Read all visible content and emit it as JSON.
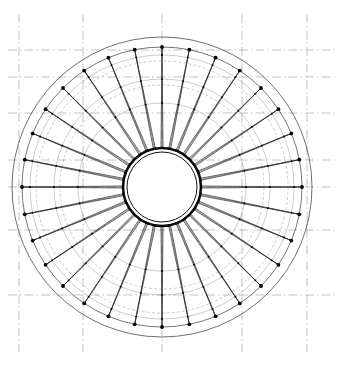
{
  "sheet": {
    "width": 342,
    "height": 366,
    "background": "#ffffff",
    "title": "",
    "caption": ""
  },
  "drawing": {
    "kind": "engineering-plan",
    "description": "Plan view of a circular spoke-wheel cable roof structure",
    "center": {
      "x": 162,
      "y": 187
    },
    "line_color": "#111111",
    "grid_color": "#9a9a9a",
    "hub_fill": "#ffffff"
  },
  "grid": {
    "style": "dash-dot",
    "color": "#9a9a9a",
    "vertical_x": [
      19,
      83,
      162,
      242,
      307
    ],
    "horizontal_y": [
      50,
      77,
      113,
      160,
      187,
      230,
      295
    ],
    "vertical_top": 14,
    "vertical_bottom": 352,
    "horizontal_left": 8,
    "horizontal_right": 336
  },
  "rings": [
    {
      "name": "outer-boundary-circle",
      "radius": 150,
      "style": "solid-thin",
      "color": "#4a4a4a"
    },
    {
      "name": "outer-node-ring",
      "radius": 140,
      "style": "solid",
      "color": "#3a3a3a"
    },
    {
      "name": "hoop-cable-ring-1",
      "radius": 132,
      "style": "solid-thin",
      "color": "#8c8c8c"
    },
    {
      "name": "hoop-cable-ring-2",
      "radius": 126,
      "style": "dashed-thin",
      "color": "#8c8c8c"
    },
    {
      "name": "hoop-cable-ring-3",
      "radius": 108,
      "style": "solid-thin",
      "color": "#8c8c8c"
    },
    {
      "name": "hoop-cable-ring-4",
      "radius": 102,
      "style": "dashed-thin",
      "color": "#8c8c8c"
    },
    {
      "name": "hoop-cable-ring-5",
      "radius": 84,
      "style": "solid-thin",
      "color": "#8c8c8c"
    },
    {
      "name": "inner-hub-ring-outer",
      "radius": 39,
      "style": "heavy",
      "color": "#101010"
    },
    {
      "name": "inner-hub-ring-inner",
      "radius": 35,
      "style": "solid",
      "color": "#101010"
    }
  ],
  "spokes": {
    "count": 32,
    "angle_step_degrees": 11.25,
    "start_angle_degrees": -90,
    "cable_pair_offset_degrees": 1.5,
    "node_radius": 140,
    "hub_radius": 39,
    "node_dot_radius": 1.9,
    "inner_node_dot_radius": 1.1
  },
  "struts": {
    "count_per_spoke": 3,
    "radii": [
      132,
      108,
      84
    ]
  },
  "hub_detail": {
    "grid_offsets": [
      -22,
      0,
      22
    ],
    "box_half_size": 11,
    "grid_extent": 33
  },
  "labels": {
    "sheet_label": "",
    "note": ""
  }
}
